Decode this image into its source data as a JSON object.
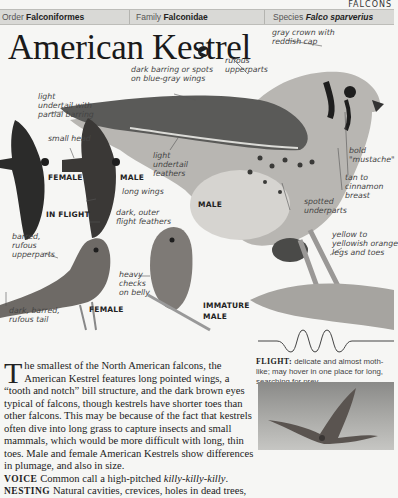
{
  "section_tag": "FALCONS",
  "taxonomy": {
    "order_label": "Order",
    "order_value": "Falconiformes",
    "family_label": "Family",
    "family_value": "Falconidae",
    "species_label": "Species",
    "species_value": "Falco sparverius"
  },
  "title": "American Kestrel",
  "audio_icon": "speaker-icon",
  "labels": {
    "gray_crown_1": "gray crown with",
    "gray_crown_2": "reddish cap",
    "rufous_up_1": "rufous",
    "rufous_up_2": "upperparts",
    "dark_barring_1": "dark barring or spots",
    "dark_barring_2": "on blue-gray wings",
    "light_undertail_partial_1": "light",
    "light_undertail_partial_2": "undertail with",
    "light_undertail_partial_3": "partial barring",
    "small_head": "small head",
    "light_undertail_feathers_1": "light",
    "light_undertail_feathers_2": "undertail",
    "light_undertail_feathers_3": "feathers",
    "long_wings": "long wings",
    "dark_outer_1": "dark, outer",
    "dark_outer_2": "flight feathers",
    "bold_mustache_1": "bold",
    "bold_mustache_2": "\"mustache\"",
    "tan_breast_1": "tan to",
    "tan_breast_2": "cinnamon",
    "tan_breast_3": "breast",
    "spotted_1": "spotted",
    "spotted_2": "underparts",
    "yellow_legs_1": "yellow to",
    "yellow_legs_2": "yellowish orange",
    "yellow_legs_3": "legs and toes",
    "barred_1": "barred,",
    "barred_2": "rufous",
    "barred_3": "upperparts",
    "heavy_checks_1": "heavy",
    "heavy_checks_2": "checks",
    "heavy_checks_3": "on belly",
    "dark_tail_1": "dark, barred,",
    "dark_tail_2": "rufous tail"
  },
  "captions": {
    "flight_female": "FEMALE",
    "flight_male": "MALE",
    "in_flight": "IN FLIGHT",
    "male": "MALE",
    "female": "FEMALE",
    "immature_1": "IMMATURE",
    "immature_2": "MALE"
  },
  "description": {
    "dropcap": "T",
    "text": "he smallest of the North American falcons, the American Kestrel features long pointed wings, a “tooth and notch” bill structure, and the dark brown eyes typical of falcons, though kestrels have shorter toes than other falcons. This may be because of the fact that kestrels often dive into long grass to capture insects and small mammals, which would be more difficult with long, thin toes. Male and female American Kestrels show differences in plumage, and also in size.",
    "voice_label": "VOICE",
    "voice_text": "Common call a high-pitched ",
    "voice_call": "killy-killy-killy",
    "voice_end": ".",
    "nesting_label": "NESTING",
    "nesting_text": "Natural cavities, crevices, holes in dead trees,"
  },
  "flight": {
    "label": "FLIGHT:",
    "text": "delicate and almost moth-like; may hover in one place for long, searching for prey."
  },
  "colors": {
    "background": "#f6f6f4",
    "taxbar": "#d9d9d6",
    "text": "#222222"
  }
}
